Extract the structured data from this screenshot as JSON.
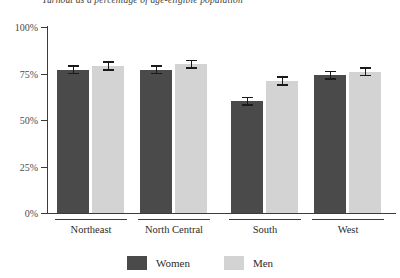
{
  "chart_data": {
    "type": "bar",
    "title": "Turnout as a percentage of age-eligible population",
    "xlabel": "",
    "ylabel": "",
    "ylim": [
      0,
      100
    ],
    "grid": false,
    "legend_position": "bottom",
    "categories": [
      "Northeast",
      "North Central",
      "South",
      "West"
    ],
    "tick_labels": [
      "0%",
      "25%",
      "50%",
      "75%",
      "100%"
    ],
    "tick_values": [
      0,
      25,
      50,
      75,
      100
    ],
    "series": [
      {
        "name": "Women",
        "color": "#4a4a4a",
        "values": [
          77,
          77,
          60,
          74
        ],
        "errors": [
          2.5,
          2.5,
          2.5,
          2.5
        ]
      },
      {
        "name": "Men",
        "color": "#d3d3d3",
        "values": [
          79,
          80,
          71,
          76
        ],
        "errors": [
          2.5,
          2.5,
          2.5,
          2.5
        ]
      }
    ]
  },
  "axis": {
    "ticks": [
      {
        "label": "100%",
        "value": 100
      },
      {
        "label": "75%",
        "value": 75
      },
      {
        "label": "50%",
        "value": 50
      },
      {
        "label": "25%",
        "value": 25
      },
      {
        "label": "0%",
        "value": 0
      }
    ]
  },
  "groups": [
    {
      "label": "Northeast"
    },
    {
      "label": "North Central"
    },
    {
      "label": "South"
    },
    {
      "label": "West"
    }
  ],
  "legend": {
    "items": [
      {
        "label": "Women",
        "color": "#4a4a4a"
      },
      {
        "label": "Men",
        "color": "#d3d3d3"
      }
    ]
  }
}
